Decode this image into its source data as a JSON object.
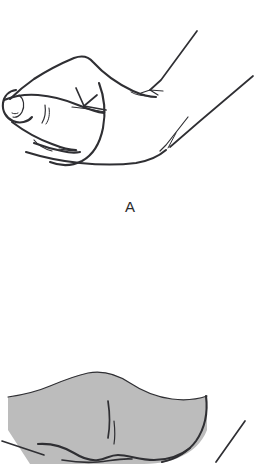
{
  "figure": {
    "kind": "line-art-illustration",
    "background_color": "#ffffff",
    "ink_color": "#2f2f33",
    "shade_color": "#bcbcbc",
    "width": 260,
    "height": 464,
    "panels": [
      {
        "id": "A",
        "caption": "A",
        "caption_x": 118,
        "caption_y": 199,
        "subject": "hand-grasping-instrument",
        "description": "Side view of a hand with thumb and fingers pinched together holding a slender instrument; two fine diagonal instrument shafts extend toward the upper right.",
        "has_shading": false
      },
      {
        "id": "B",
        "caption": "",
        "subject": "shaded-drape-over-hand",
        "description": "Lower panel, cropped by the image edge. A gray-shaded drape or tissue flap with a wavy upper border lies over a partially visible hand; a fine instrument shaft appears at the lower right.",
        "has_shading": true
      }
    ]
  },
  "caption_a": "A"
}
